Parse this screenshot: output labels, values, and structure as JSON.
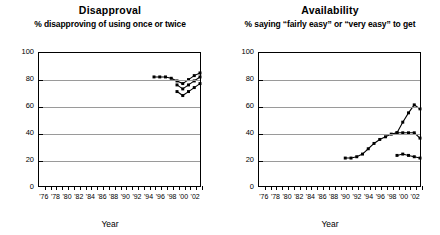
{
  "axis": {
    "xlabel": "Year",
    "yticks": [
      0,
      20,
      40,
      60,
      80,
      100
    ],
    "xticks": [
      "'76",
      "'78",
      "'80",
      "'82",
      "'84",
      "'86",
      "'88",
      "'90",
      "'92",
      "'94",
      "'96",
      "'98",
      "'00",
      "'02"
    ]
  },
  "panels": [
    {
      "title": "Disapproval",
      "subtitle": "% disapproving of using once or twice"
    },
    {
      "title": "Availability",
      "subtitle": "% saying “fairly easy” or “very easy” to get"
    }
  ],
  "chart_data": [
    {
      "type": "line",
      "title": "Disapproval",
      "subtitle": "% disapproving of using once or twice",
      "xlabel": "Year",
      "ylabel": "",
      "xlim": [
        1975,
        2003
      ],
      "ylim": [
        0,
        100
      ],
      "grid": true,
      "legend": "none",
      "series": [
        {
          "name": "series-1",
          "x": [
            1995,
            1996,
            1997,
            1998,
            1999,
            2000,
            2001,
            2002,
            2003
          ],
          "values": [
            82,
            82,
            82,
            81,
            79,
            77,
            80,
            83,
            85
          ]
        },
        {
          "name": "series-2",
          "x": [
            1999,
            2000,
            2001,
            2002,
            2003
          ],
          "values": [
            76,
            73,
            76,
            79,
            82
          ]
        },
        {
          "name": "series-3",
          "x": [
            1999,
            2000,
            2001,
            2002,
            2003
          ],
          "values": [
            71,
            68,
            71,
            74,
            77
          ]
        }
      ]
    },
    {
      "type": "line",
      "title": "Availability",
      "subtitle": "% saying “fairly easy” or “very easy” to get",
      "xlabel": "Year",
      "ylabel": "",
      "xlim": [
        1975,
        2003
      ],
      "ylim": [
        0,
        100
      ],
      "grid": true,
      "legend": "none",
      "series": [
        {
          "name": "series-1",
          "x": [
            1990,
            1991,
            1992,
            1993,
            1994,
            1995,
            1996,
            1997,
            1998,
            1999,
            2000,
            2001,
            2002,
            2003
          ],
          "values": [
            21,
            21,
            22,
            24,
            28,
            32,
            35,
            37,
            39,
            40,
            48,
            55,
            61,
            58
          ]
        },
        {
          "name": "series-2",
          "x": [
            1999,
            2000,
            2001,
            2002,
            2003
          ],
          "values": [
            40,
            40,
            40,
            40,
            36
          ]
        },
        {
          "name": "series-3",
          "x": [
            1999,
            2000,
            2001,
            2002,
            2003
          ],
          "values": [
            23,
            24,
            23,
            22,
            21
          ]
        }
      ]
    }
  ]
}
